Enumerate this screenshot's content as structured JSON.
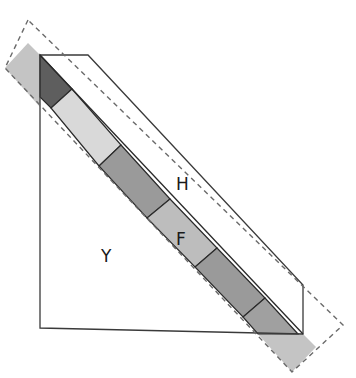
{
  "diagram": {
    "labels": {
      "H": "H",
      "F": "F",
      "Y": "Y"
    },
    "colors": {
      "outline": "#3a3a3a",
      "dashed": "#6a6a6a",
      "strip_extension": "#c4c4c4",
      "cell_dark": "#5e5e5e",
      "cell_light": "#d9d9d9",
      "cell_mid": "#9a9a9a",
      "cell_mid_light": "#bdbdbd",
      "cell_medium": "#a0a0a0"
    },
    "strip_cells": [
      "dark",
      "light",
      "mid",
      "mid-light (F)",
      "mid",
      "medium"
    ]
  }
}
